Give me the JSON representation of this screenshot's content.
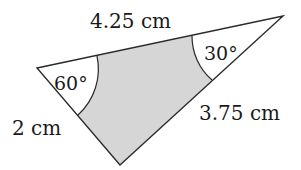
{
  "diagram": {
    "type": "triangle",
    "labels": {
      "top_side": "4.25 cm",
      "left_side": "2 cm",
      "right_side": "3.75 cm",
      "left_angle": "60°",
      "right_angle": "30°"
    },
    "colors": {
      "stroke": "#2a2a2a",
      "shaded": "#d6d6d6",
      "background": "#ffffff"
    }
  }
}
